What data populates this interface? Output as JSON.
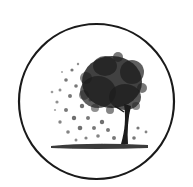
{
  "logo": {
    "name": "tree-with-scattering-leaves-emblem",
    "alt": "Tree with leaves blowing away inside a circle",
    "colors": {
      "stroke": "#1a1a1a",
      "foliage": "#1e1e1e",
      "background": "#ffffff"
    }
  }
}
